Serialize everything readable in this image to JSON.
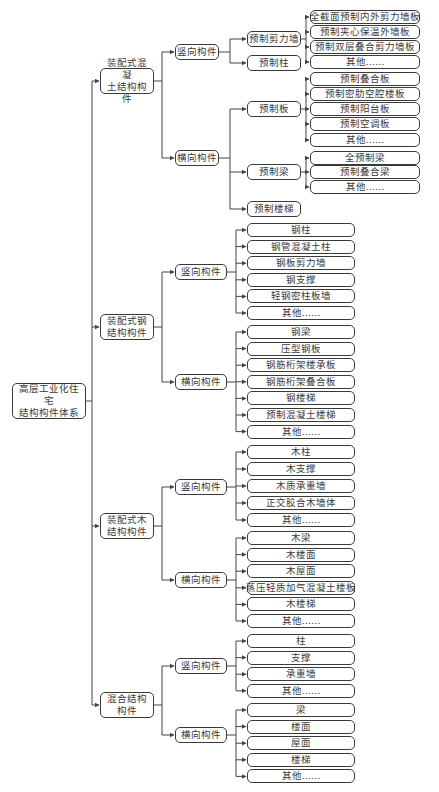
{
  "title": "高层工业化住宅结构构件体系",
  "root": {
    "label": "高层工业化住宅结构构件体系",
    "children": [
      {
        "label": "装配式混凝土结构构件",
        "children": [
          {
            "label": "竖向构件",
            "children": [
              {
                "label": "预制剪力墙",
                "children": [
                  "全截面预制内外剪力墙板",
                  "预制夹心保温外墙板",
                  "预制双层叠合剪力墙板",
                  "其他……"
                ]
              },
              {
                "label": "预制柱",
                "children": []
              }
            ]
          },
          {
            "label": "横向构件",
            "children": [
              {
                "label": "预制板",
                "children": [
                  "预制叠合板",
                  "预制密肋空腔楼板",
                  "预制阳台板",
                  "预制空调板",
                  "其他……"
                ]
              },
              {
                "label": "预制梁",
                "children": [
                  "全预制梁",
                  "预制叠合梁",
                  "其他……"
                ]
              },
              {
                "label": "预制楼梯",
                "children": []
              }
            ]
          }
        ]
      },
      {
        "label": "装配式钢结构构件",
        "children": [
          {
            "label": "竖向构件",
            "children": [
              "钢柱",
              "钢管混凝土柱",
              "钢板剪力墙",
              "钢支撑",
              "轻钢密柱板墙",
              "其他……"
            ]
          },
          {
            "label": "横向构件",
            "children": [
              "钢梁",
              "压型钢板",
              "钢筋桁架楼承板",
              "钢筋桁架叠合板",
              "钢楼梯",
              "预制混凝土楼梯",
              "其他……"
            ]
          }
        ]
      },
      {
        "label": "装配式木结构构件",
        "children": [
          {
            "label": "竖向构件",
            "children": [
              "木柱",
              "木支撑",
              "木质承重墙",
              "正交胶合木墙体",
              "其他……"
            ]
          },
          {
            "label": "横向构件",
            "children": [
              "木梁",
              "木楼面",
              "木屋面",
              "蒸压轻质加气混凝土楼板",
              "木楼梯",
              "其他……"
            ]
          }
        ]
      },
      {
        "label": "混合结构构件",
        "children": [
          {
            "label": "竖向构件",
            "children": [
              "柱",
              "支撑",
              "承重墙",
              "其他……"
            ]
          },
          {
            "label": "横向构件",
            "children": [
              "梁",
              "楼面",
              "屋面",
              "楼梯",
              "其他……"
            ]
          }
        ]
      }
    ]
  },
  "layout_labels": {
    "root_line1": "高层工业化住宅",
    "root_line2": "结构构件体系",
    "concrete_line1": "装配式混凝",
    "concrete_line2": "土结构构件",
    "steel_line1": "装配式钢",
    "steel_line2": "结构构件",
    "wood_line1": "装配式木",
    "wood_line2": "结构构件",
    "mixed_line1": "混合结构",
    "mixed_line2": "构件"
  },
  "colors": {
    "line": "#444444",
    "border": "#3a3a3a",
    "text": "#3a3a3a",
    "background": "#ffffff"
  }
}
